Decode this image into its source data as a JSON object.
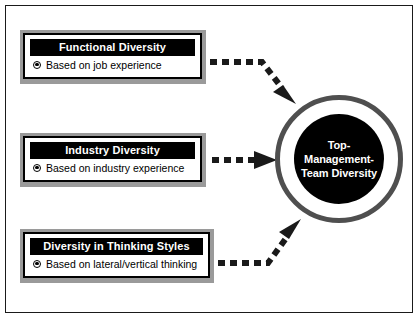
{
  "diagram": {
    "title_text": "Top-Management-Team Diversity",
    "center_node": {
      "label": "Top-Management-\nTeam Diversity",
      "shape": "concentric-circle",
      "disc_color": "#000000",
      "ring_color": "#4f4f4f",
      "gap_color": "#ffffff",
      "text_color": "#ffffff"
    },
    "drivers": [
      {
        "header": "Functional Diversity",
        "bullet": "Based on job experience",
        "bullet_icon": "radio-filled-icon",
        "header_bg": "#000000",
        "header_color": "#ffffff",
        "frame_color": "#9a9a9a"
      },
      {
        "header": "Industry Diversity",
        "bullet": "Based on industry experience",
        "bullet_icon": "radio-filled-icon",
        "header_bg": "#000000",
        "header_color": "#ffffff",
        "frame_color": "#9a9a9a"
      },
      {
        "header": "Diversity in Thinking Styles",
        "bullet": "Based on lateral/vertical thinking",
        "bullet_icon": "radio-filled-icon",
        "header_bg": "#000000",
        "header_color": "#ffffff",
        "frame_color": "#9a9a9a"
      }
    ],
    "connectors": [
      {
        "name": "arrow-functional-to-center",
        "style": "dashed",
        "direction": "down-right",
        "color": "#1a1a1a"
      },
      {
        "name": "arrow-industry-to-center",
        "style": "dashed",
        "direction": "right",
        "color": "#1a1a1a"
      },
      {
        "name": "arrow-thinking-to-center",
        "style": "dashed",
        "direction": "up-right",
        "color": "#1a1a1a"
      }
    ],
    "frame": {
      "border_color": "#1a1a1a",
      "background": "#ffffff"
    }
  }
}
